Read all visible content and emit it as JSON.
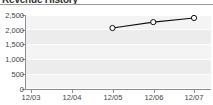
{
  "widget": {
    "title": "Revenue History"
  },
  "chart_data": {
    "type": "line",
    "title": "Revenue History",
    "xlabel": "",
    "ylabel": "",
    "categories": [
      "12/03",
      "12/04",
      "12/05",
      "12/06",
      "12/07"
    ],
    "series": [
      {
        "name": "Revenue",
        "x": [
          "12/05",
          "12/06",
          "12/07"
        ],
        "values": [
          2060,
          2260,
          2400
        ]
      }
    ],
    "ylim": [
      0,
      2500
    ],
    "ytick_labels": [
      "2,500",
      "2,000",
      "1,500",
      "1,000",
      "500",
      "0"
    ],
    "ytick_values": [
      2500,
      2000,
      1500,
      1000,
      500,
      0
    ],
    "grid": true,
    "legend": "none",
    "marker": "open-circle",
    "line_color": "#111111",
    "marker_fill": "#ffffff",
    "plot_band_color": "#ececec",
    "plot_band_alt_color": "#f4f4f4",
    "gridline_color": "#ffffff",
    "axis_color": "#8d8d8d",
    "text_color": "#444444"
  }
}
